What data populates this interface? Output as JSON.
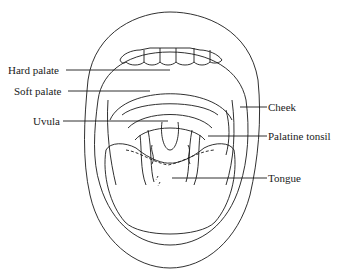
{
  "diagram": {
    "stroke_color": "#1a1a1a",
    "background": "#ffffff",
    "labels": [
      {
        "id": "hard-palate",
        "text": "Hard palate",
        "side": "left"
      },
      {
        "id": "soft-palate",
        "text": "Soft palate",
        "side": "left"
      },
      {
        "id": "uvula",
        "text": "Uvula",
        "side": "left"
      },
      {
        "id": "cheek",
        "text": "Cheek",
        "side": "right"
      },
      {
        "id": "palatine-tonsil",
        "text": "Palatine tonsil",
        "side": "right"
      },
      {
        "id": "tongue",
        "text": "Tongue",
        "side": "right"
      }
    ]
  }
}
